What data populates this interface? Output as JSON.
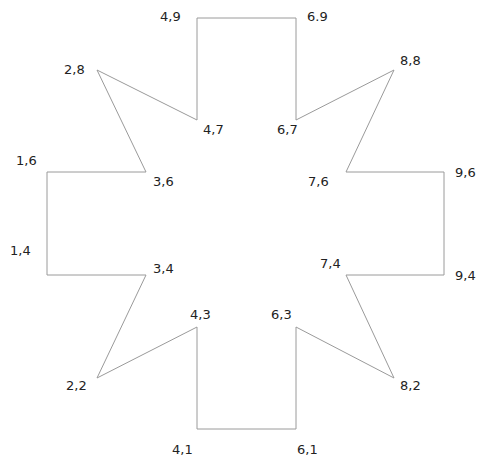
{
  "diagram": {
    "type": "polygon",
    "stroke_color": "#9a9a9a",
    "label_color": "#222222",
    "vertices": [
      {
        "label": "4,9",
        "px": [
          197,
          18
        ]
      },
      {
        "label": "6.9",
        "px": [
          296,
          18
        ]
      },
      {
        "label": "6,7",
        "px": [
          296,
          120
        ]
      },
      {
        "label": "8,8",
        "px": [
          394,
          70
        ]
      },
      {
        "label": "7,6",
        "px": [
          346,
          172
        ]
      },
      {
        "label": "9,6",
        "px": [
          444,
          172
        ]
      },
      {
        "label": "9,4",
        "px": [
          444,
          275
        ]
      },
      {
        "label": "7,4",
        "px": [
          346,
          275
        ]
      },
      {
        "label": "8,2",
        "px": [
          394,
          378
        ]
      },
      {
        "label": "6,3",
        "px": [
          296,
          327
        ]
      },
      {
        "label": "6,1",
        "px": [
          296,
          429
        ]
      },
      {
        "label": "4,1",
        "px": [
          197,
          429
        ]
      },
      {
        "label": "4,3",
        "px": [
          197,
          327
        ]
      },
      {
        "label": "2,2",
        "px": [
          97,
          378
        ]
      },
      {
        "label": "3,4",
        "px": [
          146,
          275
        ]
      },
      {
        "label": "1,4",
        "px": [
          47,
          275
        ]
      },
      {
        "label": "1,6",
        "px": [
          47,
          172
        ]
      },
      {
        "label": "3,6",
        "px": [
          146,
          172
        ]
      },
      {
        "label": "2,8",
        "px": [
          97,
          70
        ]
      },
      {
        "label": "4,7",
        "px": [
          197,
          120
        ]
      }
    ],
    "labels": {
      "v_4_9": "4,9",
      "v_6_9": "6.9",
      "v_2_8": "2,8",
      "v_8_8": "8,8",
      "v_4_7": "4,7",
      "v_6_7": "6,7",
      "v_1_6": "1,6",
      "v_3_6": "3,6",
      "v_7_6": "7,6",
      "v_9_6": "9,6",
      "v_1_4": "1,4",
      "v_3_4": "3,4",
      "v_7_4": "7,4",
      "v_9_4": "9,4",
      "v_4_3": "4,3",
      "v_6_3": "6,3",
      "v_2_2": "2,2",
      "v_8_2": "8,2",
      "v_4_1": "4,1",
      "v_6_1": "6,1"
    }
  }
}
